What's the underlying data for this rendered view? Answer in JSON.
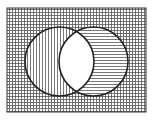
{
  "diagram": {
    "type": "venn",
    "universe": {
      "x": 7,
      "y": 8,
      "width": 139,
      "height": 104,
      "fill": "crosshatch-grid"
    },
    "sets": [
      {
        "name": "A",
        "cx": 59.5,
        "cy": 61.5,
        "r": 34.5,
        "only_region_fill": "vertical-lines"
      },
      {
        "name": "B",
        "cx": 93.5,
        "cy": 61.5,
        "r": 34.5,
        "only_region_fill": "horizontal-lines"
      }
    ],
    "intersection_fill": "white",
    "colors": {
      "stroke": "#222222",
      "hatch": "#555555",
      "background": "#ffffff"
    }
  }
}
